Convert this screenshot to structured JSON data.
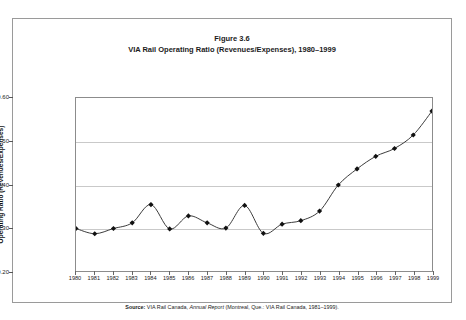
{
  "figure": {
    "title_line1": "Figure 3.6",
    "title_line2": "VIA Rail Operating Ratio (Revenues/Expenses), 1980–1999",
    "source_label": "Source:",
    "source_text_1": " VIA Rail Canada, ",
    "source_italic": "Annual Report",
    "source_text_2": "  (Montreal, Que.: VIA Rail Canada, 1981–1999)."
  },
  "colors": {
    "line": "#3a3a3a",
    "marker": "#111111",
    "grid": "#c9c9c9",
    "axis": "#8c8c8c",
    "text": "#1b1b1b",
    "frame": "#9a9a9a",
    "background": "#ffffff"
  },
  "chart_data": {
    "type": "line",
    "title": "VIA Rail Operating Ratio (Revenues/Expenses), 1980–1999",
    "subtitle": "Figure 3.6",
    "xlabel": "",
    "ylabel": "Operating Ratio (Revenues/Expenses)",
    "ylim": [
      0.2,
      0.6
    ],
    "ytick_labels": [
      "0.60",
      "0.50",
      "0.40",
      "0.30",
      "0.20"
    ],
    "ytick_values": [
      0.6,
      0.5,
      0.4,
      0.3,
      0.2
    ],
    "grid": true,
    "grid_axis": "y",
    "legend": false,
    "marker": "diamond",
    "categories": [
      "1980",
      "1981",
      "1982",
      "1983",
      "1984",
      "1985",
      "1986",
      "1987",
      "1988",
      "1989",
      "1990",
      "1991",
      "1992",
      "1993",
      "1994",
      "1995",
      "1996",
      "1997",
      "1998",
      "1999"
    ],
    "x": [
      1980,
      1981,
      1982,
      1983,
      1984,
      1985,
      1986,
      1987,
      1988,
      1989,
      1990,
      1991,
      1992,
      1993,
      1994,
      1995,
      1996,
      1997,
      1998,
      1999
    ],
    "values": [
      0.3,
      0.288,
      0.3,
      0.313,
      0.355,
      0.299,
      0.329,
      0.313,
      0.301,
      0.353,
      0.289,
      0.31,
      0.318,
      0.34,
      0.4,
      0.437,
      0.466,
      0.484,
      0.515,
      0.57
    ],
    "series": [
      {
        "name": "Operating ratio",
        "values": [
          0.3,
          0.288,
          0.3,
          0.313,
          0.355,
          0.299,
          0.329,
          0.313,
          0.301,
          0.353,
          0.289,
          0.31,
          0.318,
          0.34,
          0.4,
          0.437,
          0.466,
          0.484,
          0.515,
          0.57
        ]
      }
    ]
  }
}
